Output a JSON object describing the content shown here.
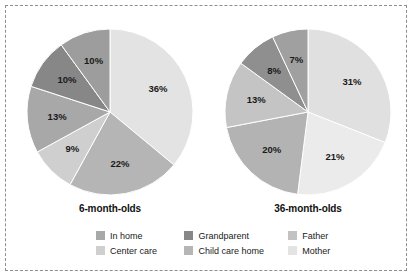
{
  "figure": {
    "background": "#ffffff",
    "border_color": "#8d8d8d"
  },
  "legend": {
    "rows": [
      [
        {
          "label": "In home",
          "color": "#a8a8a8"
        },
        {
          "label": "Grandparent",
          "color": "#878787"
        },
        {
          "label": "Father",
          "color": "#c2c2c2"
        }
      ],
      [
        {
          "label": "Center care",
          "color": "#cfcfcf"
        },
        {
          "label": "Child care home",
          "color": "#b5b5b5"
        },
        {
          "label": "Mother",
          "color": "#e3e3e3"
        }
      ]
    ]
  },
  "chart_data": [
    {
      "type": "pie",
      "title": "6-month-olds",
      "categories": [
        "Mother",
        "Child care home",
        "Center care",
        "In home",
        "Grandparent",
        "Father"
      ],
      "values": [
        36,
        22,
        9,
        13,
        10,
        10
      ],
      "labels": [
        "36%",
        "22%",
        "9%",
        "13%",
        "10%",
        "10%"
      ],
      "colors": [
        "#e3e3e3",
        "#b5b5b5",
        "#cfcfcf",
        "#a8a8a8",
        "#878787",
        "#9d9d9d"
      ],
      "start_angle_deg": 0,
      "direction": "clockwise",
      "legend_position": "bottom"
    },
    {
      "type": "pie",
      "title": "36-month-olds",
      "categories": [
        "Mother",
        "Center care",
        "Child care home",
        "In home",
        "Grandparent",
        "Father"
      ],
      "values": [
        31,
        21,
        20,
        13,
        8,
        7
      ],
      "labels": [
        "31%",
        "21%",
        "20%",
        "13%",
        "8%",
        "7%"
      ],
      "colors": [
        "#e0e0e0",
        "#ebebeb",
        "#b3b3b3",
        "#c4c4c4",
        "#8f8f8f",
        "#a0a0a0"
      ],
      "start_angle_deg": 0,
      "direction": "clockwise",
      "legend_position": "bottom"
    }
  ]
}
